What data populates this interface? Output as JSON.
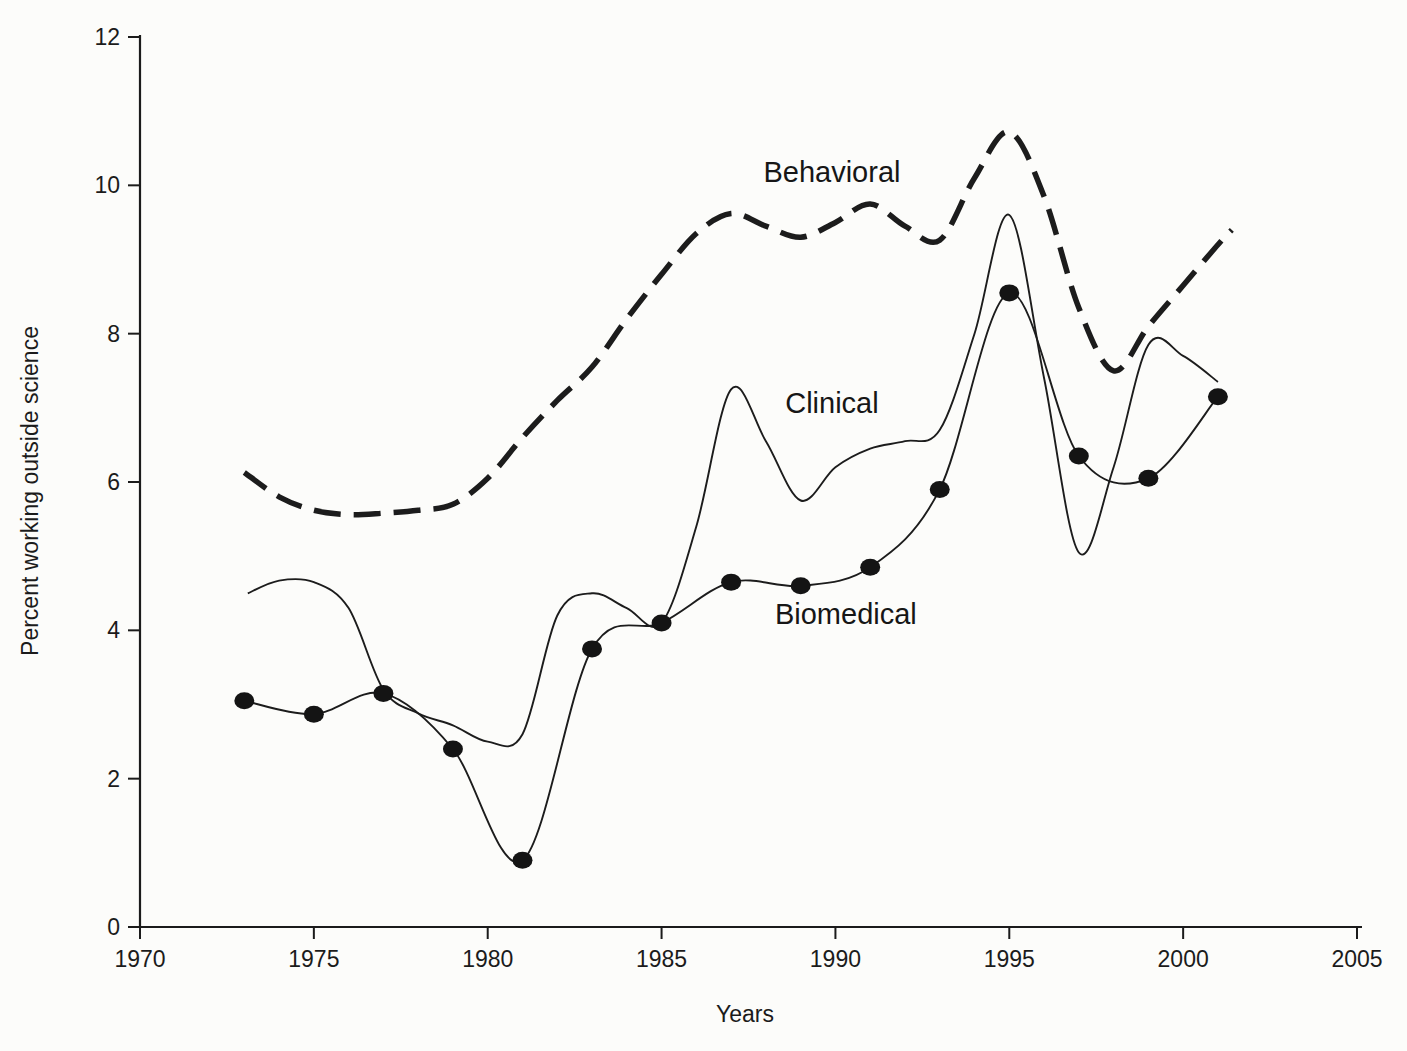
{
  "colors": {
    "background": "#fcfcfa",
    "ink": "#1b1b1b",
    "line": "#1c1c1c",
    "marker_fill": "#141414"
  },
  "chart_data": {
    "type": "line",
    "title": "",
    "xlabel": "Years",
    "ylabel": "Percent working outside science",
    "xlim": [
      1970,
      2005
    ],
    "ylim": [
      0,
      12
    ],
    "x_ticks": [
      1970,
      1975,
      1980,
      1985,
      1990,
      1995,
      2000,
      2005
    ],
    "y_ticks": [
      0,
      2,
      4,
      6,
      8,
      10,
      12
    ],
    "grid": false,
    "legend": "inline labels next to each curve",
    "series": [
      {
        "name": "Behavioral",
        "line_style": "dashed",
        "marker": "none",
        "label": {
          "text": "Behavioral",
          "year": 1989.9,
          "value": 10.18
        },
        "points": [
          [
            1973,
            6.13
          ],
          [
            1974,
            5.8
          ],
          [
            1975,
            5.62
          ],
          [
            1976,
            5.56
          ],
          [
            1977,
            5.58
          ],
          [
            1978,
            5.62
          ],
          [
            1979,
            5.7
          ],
          [
            1980,
            6.05
          ],
          [
            1981,
            6.6
          ],
          [
            1982,
            7.1
          ],
          [
            1983,
            7.55
          ],
          [
            1984,
            8.2
          ],
          [
            1985,
            8.8
          ],
          [
            1986,
            9.35
          ],
          [
            1987,
            9.62
          ],
          [
            1988,
            9.45
          ],
          [
            1989,
            9.3
          ],
          [
            1990,
            9.5
          ],
          [
            1991,
            9.75
          ],
          [
            1992,
            9.45
          ],
          [
            1993,
            9.26
          ],
          [
            1994,
            10.1
          ],
          [
            1995,
            10.72
          ],
          [
            1996,
            9.85
          ],
          [
            1997,
            8.35
          ],
          [
            1998,
            7.5
          ],
          [
            1999,
            8.1
          ],
          [
            2000,
            8.65
          ],
          [
            2001,
            9.2
          ],
          [
            2001.4,
            9.4
          ]
        ]
      },
      {
        "name": "Clinical",
        "line_style": "solid",
        "marker": "none",
        "label": {
          "text": "Clinical",
          "year": 1989.9,
          "value": 7.06
        },
        "points": [
          [
            1973.1,
            4.5
          ],
          [
            1974,
            4.67
          ],
          [
            1975,
            4.65
          ],
          [
            1976,
            4.3
          ],
          [
            1977,
            3.2
          ],
          [
            1978,
            2.88
          ],
          [
            1979,
            2.72
          ],
          [
            1980,
            2.5
          ],
          [
            1981,
            2.6
          ],
          [
            1982,
            4.2
          ],
          [
            1983,
            4.5
          ],
          [
            1984,
            4.3
          ],
          [
            1985,
            4.1
          ],
          [
            1986,
            5.4
          ],
          [
            1987,
            7.25
          ],
          [
            1988,
            6.55
          ],
          [
            1989,
            5.75
          ],
          [
            1990,
            6.2
          ],
          [
            1991,
            6.45
          ],
          [
            1992,
            6.55
          ],
          [
            1993,
            6.7
          ],
          [
            1994,
            8.0
          ],
          [
            1995,
            9.6
          ],
          [
            1996,
            7.4
          ],
          [
            1997,
            5.05
          ],
          [
            1998,
            6.2
          ],
          [
            1999,
            7.85
          ],
          [
            2000,
            7.7
          ],
          [
            2001,
            7.35
          ]
        ]
      },
      {
        "name": "Biomedical",
        "line_style": "solid",
        "marker": "filled-circle",
        "label": {
          "text": "Biomedical",
          "year": 1990.3,
          "value": 4.22
        },
        "points": [
          [
            1973,
            3.05
          ],
          [
            1975,
            2.87
          ],
          [
            1977,
            3.15
          ],
          [
            1979,
            2.4
          ],
          [
            1981,
            0.9
          ],
          [
            1983,
            3.75
          ],
          [
            1985,
            4.1
          ],
          [
            1987,
            4.65
          ],
          [
            1989,
            4.6
          ],
          [
            1991,
            4.85
          ],
          [
            1993,
            5.9
          ],
          [
            1995,
            8.55
          ],
          [
            1997,
            6.35
          ],
          [
            1999,
            6.05
          ],
          [
            2001,
            7.15
          ]
        ]
      }
    ]
  }
}
